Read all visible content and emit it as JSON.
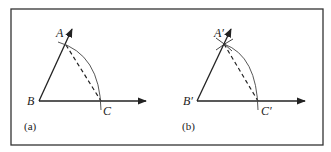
{
  "figure": {
    "frame": {
      "x": 11,
      "y": 9,
      "width": 312,
      "height": 136,
      "stroke": "#333333"
    },
    "panels": [
      {
        "id": "a",
        "caption": "(a)",
        "caption_pos": [
          24,
          130
        ],
        "vertices": {
          "A": {
            "label": "A",
            "x": 66,
            "y": 45,
            "label_x": 56,
            "label_y": 37
          },
          "B": {
            "label": "B",
            "x": 39,
            "y": 101,
            "label_x": 27,
            "label_y": 105
          },
          "C": {
            "label": "C",
            "x": 101,
            "y": 101,
            "label_x": 103,
            "label_y": 115
          }
        },
        "ray_BA_end": [
          72,
          29
        ],
        "ray_BC_end": [
          146,
          101
        ]
      },
      {
        "id": "b",
        "caption": "(b)",
        "caption_pos": [
          182,
          130
        ],
        "vertices": {
          "A": {
            "label": "A′",
            "x": 224,
            "y": 44,
            "label_x": 214,
            "label_y": 37
          },
          "B": {
            "label": "B′",
            "x": 197,
            "y": 101,
            "label_x": 183,
            "label_y": 105
          },
          "C": {
            "label": "C′",
            "x": 258,
            "y": 101,
            "label_x": 261,
            "label_y": 115
          }
        },
        "ray_BA_end": [
          231,
          29
        ],
        "ray_BC_end": [
          305,
          101
        ]
      }
    ]
  }
}
